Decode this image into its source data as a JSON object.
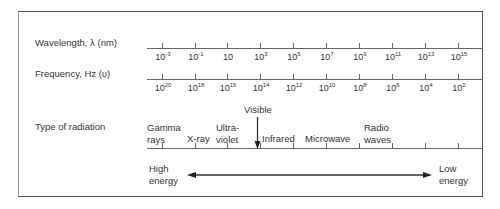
{
  "rows": {
    "wavelength": {
      "label": "Wavelength, λ (nm)",
      "ticks": [
        {
          "base": "10",
          "exp": "-3"
        },
        {
          "base": "10",
          "exp": "-1"
        },
        {
          "base": "10",
          "exp": ""
        },
        {
          "base": "10",
          "exp": "3"
        },
        {
          "base": "10",
          "exp": "5"
        },
        {
          "base": "10",
          "exp": "7"
        },
        {
          "base": "10",
          "exp": "9"
        },
        {
          "base": "10",
          "exp": "11"
        },
        {
          "base": "10",
          "exp": "13"
        },
        {
          "base": "10",
          "exp": "15"
        }
      ]
    },
    "frequency": {
      "label": "Frequency, Hz (υ)",
      "ticks": [
        {
          "base": "10",
          "exp": "20"
        },
        {
          "base": "10",
          "exp": "18"
        },
        {
          "base": "10",
          "exp": "16"
        },
        {
          "base": "10",
          "exp": "14"
        },
        {
          "base": "10",
          "exp": "12"
        },
        {
          "base": "10",
          "exp": "10"
        },
        {
          "base": "10",
          "exp": "8"
        },
        {
          "base": "10",
          "exp": "6"
        },
        {
          "base": "10",
          "exp": "4"
        },
        {
          "base": "10",
          "exp": "2"
        }
      ]
    },
    "radiation": {
      "label": "Type of radiation",
      "types": [
        {
          "line1": "Gamma",
          "line2": "rays"
        },
        {
          "line1": "",
          "line2": "X-ray"
        },
        {
          "line1": "Ultra-",
          "line2": "violet"
        },
        {
          "line1": "Visible",
          "line2": ""
        },
        {
          "line1": "",
          "line2": "Infrared"
        },
        {
          "line1": "",
          "line2": "Microwave"
        },
        {
          "line1": "Radio",
          "line2": "waves"
        }
      ]
    }
  },
  "energy": {
    "high_line1": "High",
    "high_line2": "energy",
    "low_line1": "Low",
    "low_line2": "energy"
  },
  "colors": {
    "line": "#555555",
    "text": "#333333"
  }
}
